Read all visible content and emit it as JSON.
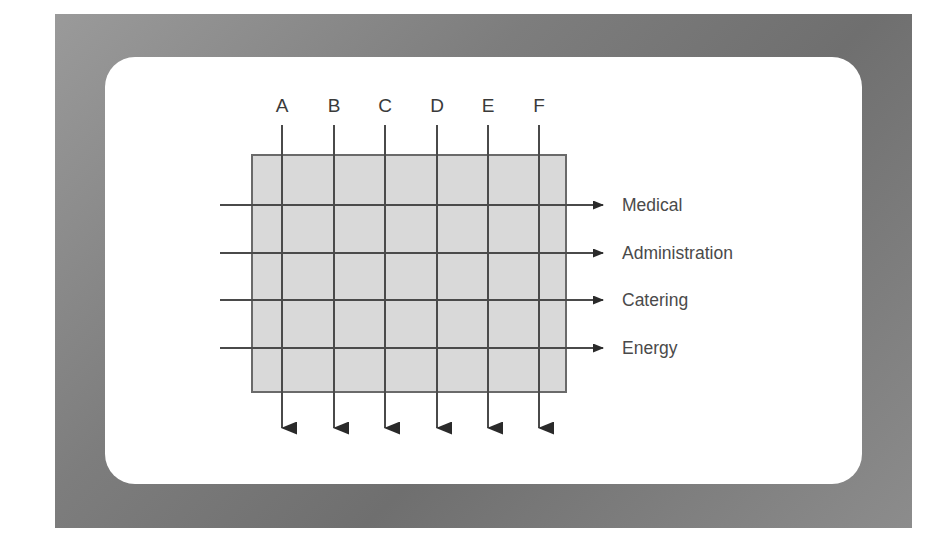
{
  "figure": {
    "title": "",
    "background_color": "#ffffff",
    "frame_color": "#7d7d7d",
    "card_color": "#ffffff",
    "box_fill_color": "#d9d9d9",
    "line_color": "#4a4a4a",
    "text_color": "#4a4a4a"
  },
  "chart_data": {
    "type": "diagram",
    "diagram_kind": "grid-matrix-with-arrows",
    "title": "",
    "columns": [
      {
        "id": "A",
        "label": "A",
        "x": 282
      },
      {
        "id": "B",
        "label": "B",
        "x": 334
      },
      {
        "id": "C",
        "label": "C",
        "x": 385
      },
      {
        "id": "D",
        "label": "D",
        "x": 437
      },
      {
        "id": "E",
        "label": "E",
        "x": 488
      },
      {
        "id": "F",
        "label": "F",
        "x": 539
      }
    ],
    "rows": [
      {
        "id": "medical",
        "label": "Medical",
        "y": 205
      },
      {
        "id": "administration",
        "label": "Administration",
        "y": 253
      },
      {
        "id": "catering",
        "label": "Catering",
        "y": 300
      },
      {
        "id": "energy",
        "label": "Energy",
        "y": 348
      }
    ],
    "box": {
      "x": 252,
      "y": 155,
      "width": 314,
      "height": 237
    },
    "column_line": {
      "y_start": 125,
      "y_end": 444,
      "arrow": "down"
    },
    "row_line": {
      "x_start": 220,
      "x_end": 614,
      "arrow": "right"
    },
    "column_label_y": 112,
    "row_label_x": 622,
    "legend": [],
    "annotations": []
  }
}
